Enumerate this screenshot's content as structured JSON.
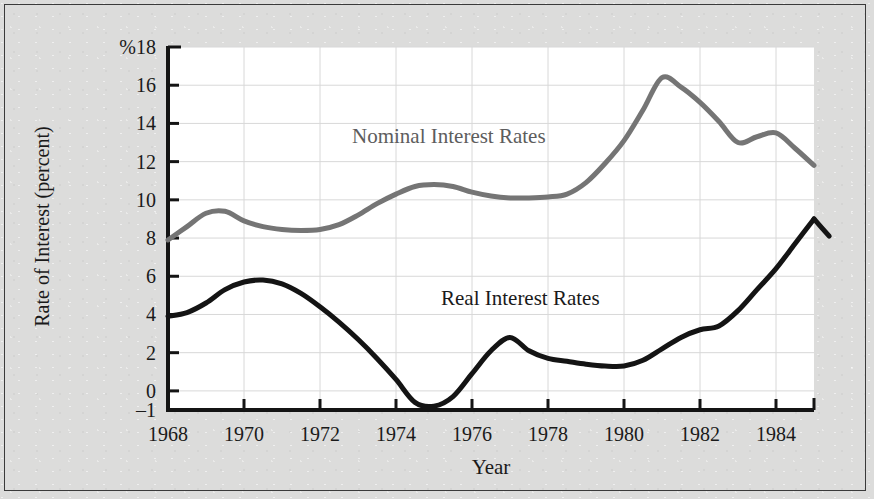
{
  "figure": {
    "background_color": "#dcdcdb",
    "plot_background_color": "#ffffff",
    "frame_color": "#3a3a3a"
  },
  "annotations": {
    "nominal": "Nominal Interest Rates",
    "real": "Real Interest Rates"
  },
  "chart_data": {
    "type": "line",
    "title": "",
    "xlabel": "Year",
    "ylabel": "Rate of Interest (percent)",
    "y_unit_prefix": "%",
    "xlim": [
      1968,
      1985
    ],
    "ylim": [
      -1,
      18
    ],
    "xticks": [
      1968,
      1970,
      1972,
      1974,
      1976,
      1978,
      1980,
      1982,
      1984
    ],
    "xtick_labels": [
      "1968",
      "1970",
      "1972",
      "1974",
      "1976",
      "1978",
      "1980",
      "1982",
      "1984"
    ],
    "yticks": [
      -1,
      0,
      2,
      4,
      6,
      8,
      10,
      12,
      14,
      16,
      18
    ],
    "ytick_labels": [
      "–1",
      "0",
      "2",
      "4",
      "6",
      "8",
      "10",
      "12",
      "14",
      "16",
      "%18"
    ],
    "grid": true,
    "grid_color": "#d8d8d8",
    "legend": "inline-annotations",
    "series": [
      {
        "name": "Nominal Interest Rates",
        "color": "#757575",
        "line_width": 5,
        "x": [
          1968,
          1968.5,
          1969,
          1969.5,
          1970,
          1970.5,
          1971,
          1971.5,
          1972,
          1972.5,
          1973,
          1973.5,
          1974,
          1974.5,
          1975,
          1975.5,
          1976,
          1976.5,
          1977,
          1977.5,
          1978,
          1978.5,
          1979,
          1979.5,
          1980,
          1980.5,
          1981,
          1981.5,
          1982,
          1982.5,
          1983,
          1983.5,
          1984,
          1984.5,
          1985
        ],
        "values": [
          7.9,
          8.6,
          9.3,
          9.4,
          8.9,
          8.6,
          8.45,
          8.4,
          8.45,
          8.7,
          9.2,
          9.8,
          10.3,
          10.7,
          10.8,
          10.7,
          10.4,
          10.2,
          10.1,
          10.1,
          10.15,
          10.3,
          10.9,
          11.9,
          13.1,
          14.7,
          16.4,
          15.9,
          15.1,
          14.1,
          13.0,
          13.3,
          13.5,
          12.7,
          11.8
        ]
      },
      {
        "name": "Real Interest Rates",
        "color": "#141414",
        "line_width": 5,
        "x": [
          1968,
          1968.5,
          1969,
          1969.5,
          1970,
          1970.5,
          1971,
          1971.5,
          1972,
          1972.5,
          1973,
          1973.5,
          1974,
          1974.5,
          1975,
          1975.5,
          1976,
          1976.5,
          1977,
          1977.5,
          1978,
          1978.5,
          1979,
          1979.5,
          1980,
          1980.5,
          1981,
          1981.5,
          1982,
          1982.5,
          1983,
          1983.5,
          1984,
          1984.5,
          1985
        ],
        "values": [
          3.9,
          4.1,
          4.6,
          5.3,
          5.7,
          5.8,
          5.6,
          5.1,
          4.4,
          3.6,
          2.7,
          1.7,
          0.6,
          -0.6,
          -0.8,
          -0.3,
          0.9,
          2.1,
          2.8,
          2.1,
          1.7,
          1.55,
          1.4,
          1.3,
          1.3,
          1.6,
          2.2,
          2.8,
          3.2,
          3.4,
          4.2,
          5.3,
          6.4,
          7.7,
          9.0
        ],
        "tail_x": [
          1985,
          1985.4
        ],
        "tail_values": [
          9.0,
          8.1
        ]
      }
    ]
  }
}
